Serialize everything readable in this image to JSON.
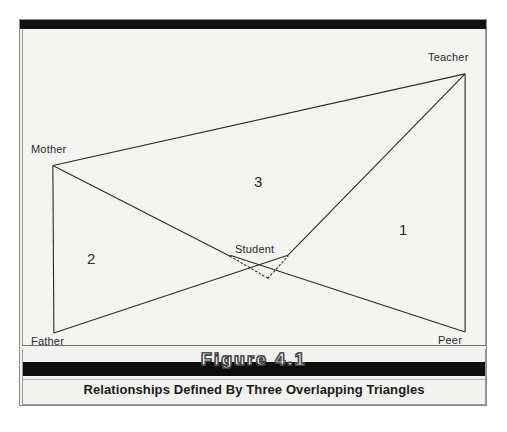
{
  "figure": {
    "number_label": "Figure 4.1",
    "caption": "Relationships Defined By Three Overlapping Triangles"
  },
  "diagram": {
    "type": "venn-style overlapping triangles",
    "nodes": [
      {
        "id": "mother",
        "label": "Mother",
        "x": 50,
        "y": 155
      },
      {
        "id": "father",
        "label": "Father",
        "x": 51,
        "y": 323
      },
      {
        "id": "teacher",
        "label": "Teacher",
        "x": 465,
        "y": 63
      },
      {
        "id": "peer",
        "label": "Peer",
        "x": 465,
        "y": 322
      },
      {
        "id": "student",
        "label": "Student",
        "x": 258,
        "y": 240
      }
    ],
    "regions": [
      {
        "id": "region-1",
        "label": "1",
        "x": 402,
        "y": 210
      },
      {
        "id": "region-2",
        "label": "2",
        "x": 88,
        "y": 239
      },
      {
        "id": "region-3",
        "label": "3",
        "x": 255,
        "y": 163
      }
    ],
    "edges": [
      {
        "from": "mother",
        "to": "teacher",
        "style": "solid"
      },
      {
        "from": "mother",
        "to": "father",
        "style": "solid"
      },
      {
        "from": "teacher",
        "to": "peer",
        "style": "solid"
      },
      {
        "from": "mother",
        "to": "student",
        "style": "solid"
      },
      {
        "from": "father",
        "to": "student",
        "style": "solid"
      },
      {
        "from": "teacher",
        "to": "student",
        "style": "solid"
      },
      {
        "from": "peer",
        "to": "student",
        "style": "solid"
      },
      {
        "from": "student-left",
        "to": "student-apex",
        "style": "dotted"
      },
      {
        "from": "student-apex",
        "to": "student-right",
        "style": "dotted"
      }
    ],
    "colors": {
      "line": "#2b2b2b",
      "background": "#f4f4f1",
      "band": "#0d0d0d",
      "text": "#2a2a2a"
    }
  }
}
